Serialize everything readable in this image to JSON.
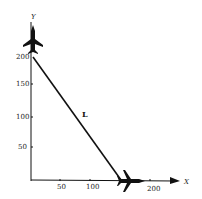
{
  "diagram": {
    "x_axis_label": "X",
    "y_axis_label": "Y",
    "line_label": "L",
    "x_ticks": [
      "50",
      "100",
      "200"
    ],
    "y_ticks": [
      "50",
      "100",
      "150",
      "200"
    ],
    "line": {
      "start": [
        0,
        200
      ],
      "end": [
        150,
        0
      ]
    },
    "icons": [
      "airplane-icon-top",
      "airplane-icon-bottom"
    ],
    "colors": {
      "ink": "#111111",
      "background": "#ffffff"
    }
  }
}
